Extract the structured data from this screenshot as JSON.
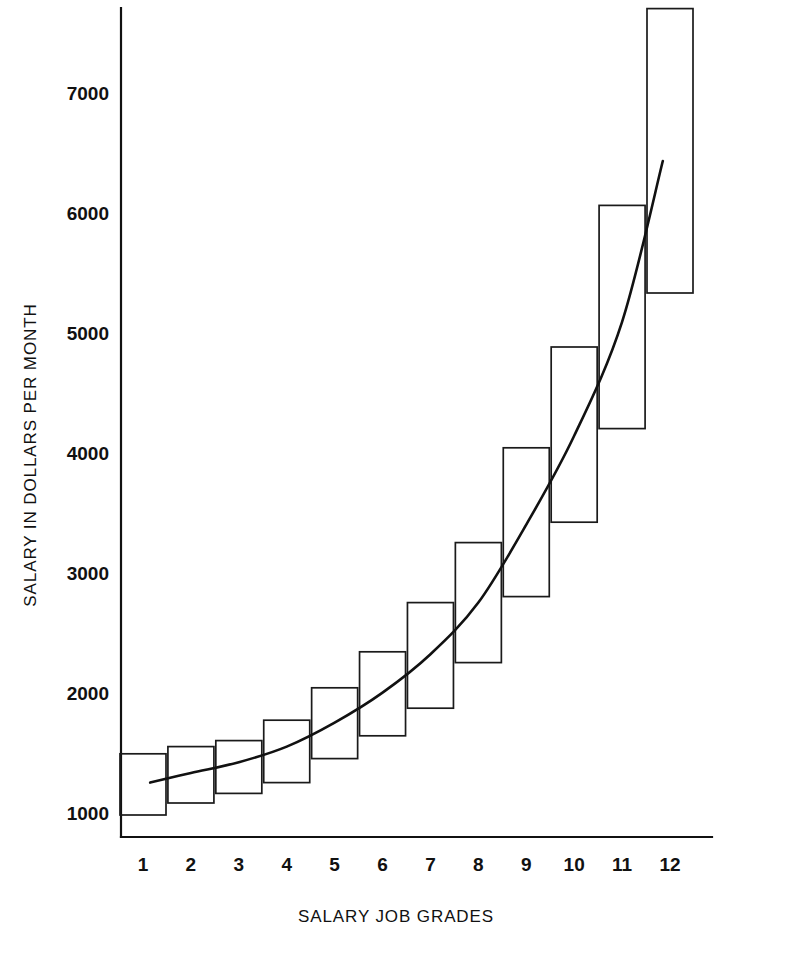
{
  "chart_data": {
    "type": "bar",
    "title": "",
    "subtitle": "",
    "xlabel": "SALARY JOB GRADES",
    "ylabel": "SALARY IN DOLLARS PER MONTH",
    "categories": [
      "1",
      "2",
      "3",
      "4",
      "5",
      "6",
      "7",
      "8",
      "9",
      "10",
      "11",
      "12"
    ],
    "xlim": [
      0.4,
      12.6
    ],
    "ylim": [
      850,
      7800
    ],
    "yticks": [
      1000,
      2000,
      3000,
      4000,
      5000,
      6000,
      7000
    ],
    "ytick_labels": [
      "1000",
      "2000",
      "3000",
      "4000",
      "5000",
      "6000",
      "7000"
    ],
    "grid": false,
    "legend": null,
    "series": [
      {
        "name": "Salary range minimum",
        "values": [
          1000,
          1100,
          1180,
          1270,
          1470,
          1660,
          1890,
          2270,
          2820,
          3440,
          4220,
          5350
        ]
      },
      {
        "name": "Salary range maximum",
        "values": [
          1510,
          1570,
          1620,
          1790,
          2060,
          2360,
          2770,
          3270,
          4060,
          4900,
          6080,
          7720
        ]
      },
      {
        "name": "Midpoint trend curve",
        "values": [
          1270,
          1350,
          1420,
          1550,
          1760,
          2010,
          2330,
          2760,
          3410,
          4150,
          5100,
          6450
        ]
      }
    ],
    "boxes": [
      {
        "grade": "1",
        "min": 1000,
        "max": 1510
      },
      {
        "grade": "2",
        "min": 1100,
        "max": 1570
      },
      {
        "grade": "3",
        "min": 1180,
        "max": 1620
      },
      {
        "grade": "4",
        "min": 1270,
        "max": 1790
      },
      {
        "grade": "5",
        "min": 1470,
        "max": 2060
      },
      {
        "grade": "6",
        "min": 1660,
        "max": 2360
      },
      {
        "grade": "7",
        "min": 1890,
        "max": 2770
      },
      {
        "grade": "8",
        "min": 2270,
        "max": 3270
      },
      {
        "grade": "9",
        "min": 2820,
        "max": 4060
      },
      {
        "grade": "10",
        "min": 3440,
        "max": 4900
      },
      {
        "grade": "11",
        "min": 4220,
        "max": 6080
      },
      {
        "grade": "12",
        "min": 5350,
        "max": 7720
      }
    ],
    "curve_points": [
      {
        "grade": 1.15,
        "value": 1270
      },
      {
        "grade": 2.0,
        "value": 1350
      },
      {
        "grade": 3.0,
        "value": 1440
      },
      {
        "grade": 4.0,
        "value": 1570
      },
      {
        "grade": 5.0,
        "value": 1770
      },
      {
        "grade": 6.0,
        "value": 2020
      },
      {
        "grade": 7.0,
        "value": 2340
      },
      {
        "grade": 8.0,
        "value": 2770
      },
      {
        "grade": 9.0,
        "value": 3420
      },
      {
        "grade": 10.0,
        "value": 4160
      },
      {
        "grade": 11.0,
        "value": 5110
      },
      {
        "grade": 11.85,
        "value": 6450
      }
    ],
    "colors": {
      "axis": "#111111",
      "box_stroke": "#1a1a1a",
      "curve": "#111111",
      "background": "#ffffff"
    }
  }
}
